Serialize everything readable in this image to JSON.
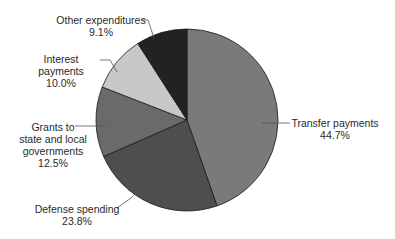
{
  "chart_data": {
    "type": "pie",
    "title": "",
    "start_angle": "12 o'clock",
    "direction": "clockwise",
    "slices": [
      {
        "label": "Transfer payments",
        "value": 44.7,
        "value_label": "44.7%",
        "color": "#7a7a7a"
      },
      {
        "label": "Defense spending",
        "value": 23.8,
        "value_label": "23.8%",
        "color": "#4e4e4e"
      },
      {
        "label": "Grants to state and local governments",
        "value": 12.5,
        "value_label": "12.5%",
        "color": "#6a6a6a"
      },
      {
        "label": "Interest payments",
        "value": 10.0,
        "value_label": "10.0%",
        "color": "#c8c8c8"
      },
      {
        "label": "Other expenditures",
        "value": 9.1,
        "value_label": "9.1%",
        "color": "#222222"
      }
    ]
  },
  "labels": {
    "transfer": {
      "line1": "Transfer payments",
      "pct": "44.7%"
    },
    "defense": {
      "line1": "Defense spending",
      "pct": "23.8%"
    },
    "grants": {
      "line1": "Grants to",
      "line2": "state and local",
      "line3": "governments",
      "pct": "12.5%"
    },
    "interest": {
      "line1": "Interest payments",
      "pct": "10.0%"
    },
    "other": {
      "line1": "Other expenditures",
      "pct": "9.1%"
    }
  }
}
